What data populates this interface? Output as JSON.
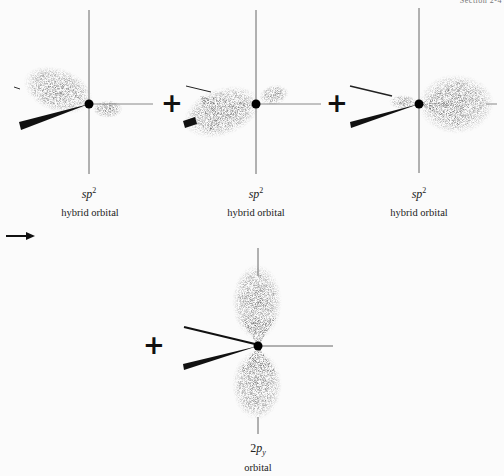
{
  "header": {
    "section": "Section 2-4"
  },
  "orbitals": [
    {
      "symbol": "sp",
      "superscript": "2",
      "description": "hybrid orbital"
    },
    {
      "symbol": "sp",
      "superscript": "2",
      "description": "hybrid orbital"
    },
    {
      "symbol": "sp",
      "superscript": "2",
      "description": "hybrid orbital"
    },
    {
      "prefix": "2",
      "symbol": "p",
      "subscript": "y",
      "description": "orbital"
    }
  ],
  "operators": {
    "plus": "+",
    "arrow": "→"
  },
  "colors": {
    "axis": "#555555",
    "nucleus": "#000000",
    "cloud": "#808080",
    "wedge": "#111111"
  }
}
